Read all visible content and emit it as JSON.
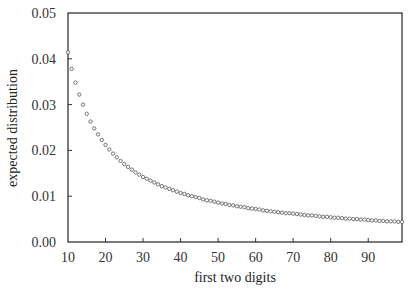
{
  "chart_data": {
    "type": "scatter",
    "title": "",
    "xlabel": "first two digits",
    "ylabel": "expected distribution",
    "xlim": [
      10,
      99
    ],
    "ylim": [
      0,
      0.05
    ],
    "x_ticks": [
      "10",
      "20",
      "30",
      "40",
      "50",
      "60",
      "70",
      "80",
      "90"
    ],
    "y_ticks": [
      "0.00",
      "0.01",
      "0.02",
      "0.03",
      "0.04",
      "0.05"
    ],
    "grid": false,
    "legend": null,
    "marker": "open-circle",
    "series": [
      {
        "name": "Benford first-two-digit distribution",
        "x": [
          10,
          11,
          12,
          13,
          14,
          15,
          16,
          17,
          18,
          19,
          20,
          21,
          22,
          23,
          24,
          25,
          26,
          27,
          28,
          29,
          30,
          31,
          32,
          33,
          34,
          35,
          36,
          37,
          38,
          39,
          40,
          41,
          42,
          43,
          44,
          45,
          46,
          47,
          48,
          49,
          50,
          51,
          52,
          53,
          54,
          55,
          56,
          57,
          58,
          59,
          60,
          61,
          62,
          63,
          64,
          65,
          66,
          67,
          68,
          69,
          70,
          71,
          72,
          73,
          74,
          75,
          76,
          77,
          78,
          79,
          80,
          81,
          82,
          83,
          84,
          85,
          86,
          87,
          88,
          89,
          90,
          91,
          92,
          93,
          94,
          95,
          96,
          97,
          98,
          99
        ],
        "values": [
          0.0414,
          0.0378,
          0.0348,
          0.0322,
          0.03,
          0.028,
          0.0263,
          0.0248,
          0.0235,
          0.0223,
          0.0212,
          0.0202,
          0.0193,
          0.0185,
          0.0177,
          0.017,
          0.0164,
          0.0158,
          0.0152,
          0.0147,
          0.0142,
          0.0138,
          0.0134,
          0.013,
          0.0126,
          0.0122,
          0.0119,
          0.0116,
          0.0113,
          0.011,
          0.0107,
          0.0105,
          0.0102,
          0.01,
          0.0098,
          0.0096,
          0.0093,
          0.0091,
          0.009,
          0.0088,
          0.0086,
          0.0084,
          0.0083,
          0.0081,
          0.008,
          0.0078,
          0.0077,
          0.0076,
          0.0074,
          0.0073,
          0.0072,
          0.0071,
          0.0069,
          0.0068,
          0.0067,
          0.0066,
          0.0065,
          0.0064,
          0.0063,
          0.0063,
          0.0062,
          0.0061,
          0.006,
          0.0059,
          0.0058,
          0.0058,
          0.0057,
          0.0056,
          0.0055,
          0.0055,
          0.0054,
          0.0053,
          0.0053,
          0.0052,
          0.0051,
          0.0051,
          0.005,
          0.005,
          0.0049,
          0.0049,
          0.0048,
          0.0047,
          0.0047,
          0.0046,
          0.0046,
          0.0045,
          0.0045,
          0.0045,
          0.0044,
          0.0044
        ]
      }
    ]
  },
  "colors": {
    "axis": "#333333",
    "marker_stroke": "#555555",
    "background": "#ffffff"
  }
}
